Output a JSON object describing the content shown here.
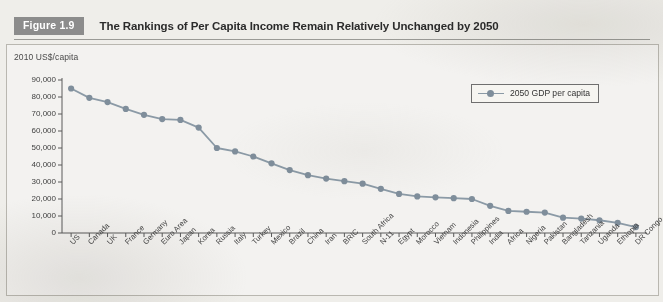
{
  "figure": {
    "badge": "Figure 1.9",
    "title": "The Rankings of Per Capita Income Remain Relatively Unchanged by 2050"
  },
  "chart_data": {
    "type": "line",
    "title": "The Rankings of Per Capita Income Remain Relatively Unchanged by 2050",
    "subtitle": "",
    "xlabel": "",
    "ylabel": "2010 US$/capita",
    "ylim": [
      0,
      90000
    ],
    "yticks": [
      0,
      10000,
      20000,
      30000,
      40000,
      50000,
      60000,
      70000,
      80000,
      90000
    ],
    "ytick_labels": [
      "0",
      "10,000",
      "20,000",
      "30,000",
      "40,000",
      "50,000",
      "60,000",
      "70,000",
      "80,000",
      "90,000"
    ],
    "grid": false,
    "legend_position": "upper-right",
    "marker": "circle",
    "categories": [
      "US",
      "Canada",
      "UK",
      "France",
      "Germany",
      "Euro Area",
      "Japan",
      "Korea",
      "Russia",
      "Italy",
      "Turkey",
      "Mexico",
      "Brazil",
      "China",
      "Iran",
      "BRIC",
      "South Africa",
      "N-11",
      "Egypt",
      "Morocco",
      "Vietnam",
      "Indonesia",
      "Philippines",
      "India",
      "Africa",
      "Nigeria",
      "Pakistan",
      "Bangladesh",
      "Tanzania",
      "Uganda",
      "Ethiopia",
      "DR Congo"
    ],
    "series": [
      {
        "name": "2050 GDP per capita",
        "color": "#8b9aa6",
        "values": [
          85000,
          79500,
          77000,
          73000,
          69500,
          67000,
          66500,
          62000,
          50000,
          48000,
          45000,
          41000,
          37000,
          34000,
          32000,
          30500,
          29000,
          26000,
          23000,
          21500,
          21000,
          20500,
          20000,
          16000,
          13000,
          12500,
          12000,
          9000,
          8500,
          7500,
          6000,
          3500
        ]
      }
    ],
    "colors": {
      "series": "#8b9aa6",
      "marker": "#7f8e9b",
      "axis": "#5a5a5a",
      "badge": "#8c8c8c",
      "page_background": "#efeeea"
    }
  },
  "legend": {
    "entries": [
      {
        "label": "2050 GDP per capita"
      }
    ]
  }
}
